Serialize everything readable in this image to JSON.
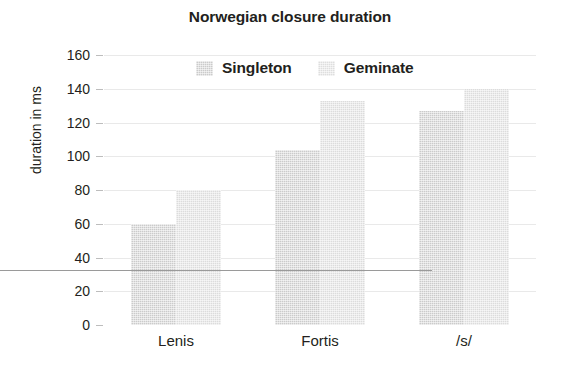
{
  "chart_data": {
    "type": "bar",
    "title": "Norwegian closure duration",
    "xlabel": "",
    "ylabel": "duration in ms",
    "categories": [
      "Lenis",
      "Fortis",
      "/s/"
    ],
    "series": [
      {
        "name": "Singleton",
        "values": [
          60,
          104,
          127
        ],
        "color": "#cbcbcb"
      },
      {
        "name": "Geminate",
        "values": [
          80,
          133,
          140
        ],
        "color": "#dcdcdc"
      }
    ],
    "ylim": [
      0,
      160
    ],
    "yticks": [
      0,
      20,
      40,
      60,
      80,
      100,
      120,
      140,
      160
    ],
    "ytick_labels": [
      "0",
      "20",
      "40",
      "60",
      "80",
      "100",
      "120",
      "140",
      "160"
    ],
    "grid": true,
    "legend_position": "top-center"
  },
  "legend": {
    "items": [
      {
        "label": "Singleton"
      },
      {
        "label": "Geminate"
      }
    ]
  }
}
